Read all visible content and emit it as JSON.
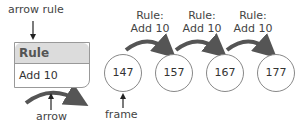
{
  "legend": {
    "arrow_rule_label": "arrow rule",
    "rule_box": {
      "header": "Rule",
      "body": "Add 10"
    },
    "arrow_label": "arrow",
    "frame_label": "frame"
  },
  "sequence": {
    "frames": [
      {
        "value": "147"
      },
      {
        "value": "157"
      },
      {
        "value": "167"
      },
      {
        "value": "177"
      }
    ],
    "rules": [
      {
        "line1": "Rule:",
        "line2": "Add 10"
      },
      {
        "line1": "Rule:",
        "line2": "Add 10"
      },
      {
        "line1": "Rule:",
        "line2": "Add 10"
      }
    ]
  },
  "colors": {
    "arrow": "#555555",
    "header_bg": "#dcdcdc",
    "border": "#999999"
  }
}
